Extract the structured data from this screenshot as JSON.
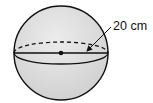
{
  "diagram": {
    "shape": "sphere",
    "fill_color": "#d9d9d9",
    "stroke_color": "#111111",
    "center": {
      "x": 61,
      "y": 53
    },
    "radius": 47,
    "diameter_label": "20 cm",
    "features": [
      "equator-ellipse (dashed back, solid front)",
      "diameter line",
      "center point",
      "label arrow"
    ]
  }
}
